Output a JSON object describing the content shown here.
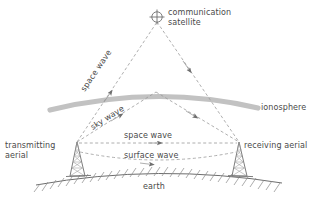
{
  "diagram": {
    "background_color": "#ffffff",
    "line_color": "#8c8c8c",
    "text_color": "#4a4a4a",
    "ionosphere_color": "#bfbfbf",
    "labels": {
      "communication_satellite_line1": "communication",
      "communication_satellite_line2": "satellite",
      "space_wave_upper": "space wave",
      "sky_wave": "sky wave",
      "ionosphere": "ionosphere",
      "space_wave_direct": "space wave",
      "surface_wave": "surface wave",
      "transmitting_aerial_line1": "transmitting",
      "transmitting_aerial_line2": "aerial",
      "receiving_aerial": "receiving aerial",
      "earth": "earth"
    },
    "icons": {
      "satellite": "satellite-crosshair-icon",
      "transmitting_tower": "antenna-mast-icon",
      "receiving_tower": "antenna-mast-icon",
      "ionosphere_band": "ionosphere-arc-icon",
      "earth_surface": "earth-hatched-ground-icon"
    },
    "paths": {
      "satellite_point": {
        "x": 157,
        "y": 18
      },
      "sky_wave_reflection_point": {
        "x": 156,
        "y": 92
      },
      "transmitting_aerial_top": {
        "x": 77,
        "y": 142
      },
      "receiving_aerial_top": {
        "x": 239,
        "y": 142
      }
    }
  }
}
